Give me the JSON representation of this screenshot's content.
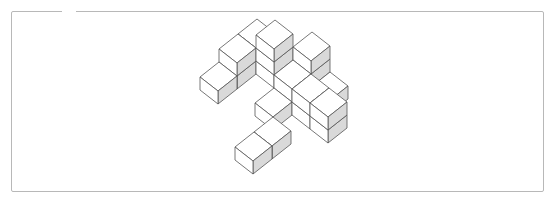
{
  "figure": {
    "type": "isometric-cube-structure",
    "colors": {
      "top_face": "#ffffff",
      "left_face": "#ffffff",
      "right_face": "#d9d9d9",
      "edge": "#555555",
      "frame": "#b8b8b8"
    },
    "projection": {
      "origin": [
        200,
        90
      ],
      "axis_i": [
        18,
        14
      ],
      "axis_j": [
        19,
        -15
      ],
      "axis_k": [
        0,
        -13
      ]
    },
    "voxels": [
      [
        0,
        1,
        0
      ],
      [
        0,
        2,
        0
      ],
      [
        0,
        2,
        1
      ],
      [
        0,
        1,
        1
      ],
      [
        0,
        0,
        0
      ],
      [
        1,
        2,
        0
      ],
      [
        1,
        2,
        1
      ],
      [
        1,
        2,
        2
      ],
      [
        2,
        2,
        -1
      ],
      [
        2,
        2,
        0
      ],
      [
        3,
        -1,
        -1
      ],
      [
        3,
        0,
        -1
      ],
      [
        2,
        1,
        -1
      ],
      [
        2,
        3,
        -1
      ],
      [
        2,
        3,
        0
      ],
      [
        2,
        3,
        1
      ],
      [
        3,
        2,
        -1
      ],
      [
        3,
        2,
        0
      ],
      [
        3,
        3,
        -1
      ],
      [
        4,
        2,
        -1
      ],
      [
        4,
        2,
        0
      ]
    ]
  }
}
